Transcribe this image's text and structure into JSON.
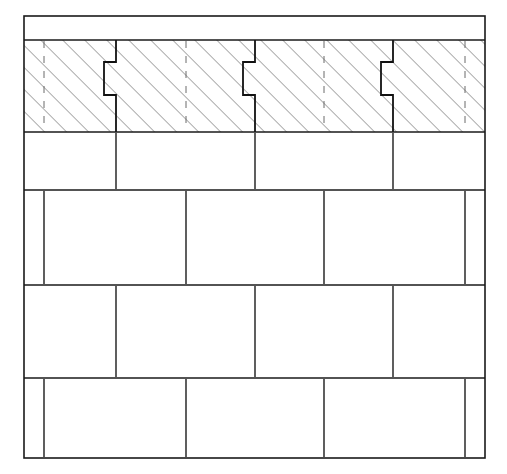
{
  "document": {
    "title": "Masonry Wall Bond — Section and Elevation",
    "drawing_type": "technical-line-drawing",
    "units": "pixels",
    "canvas": {
      "width": 507,
      "height": 474
    },
    "background_color": "#ffffff",
    "line_color": "#1a1a1a",
    "hatch_color": "#555555",
    "dashed_color": "#6a6a6a"
  },
  "geometry": {
    "outline": {
      "x": 24,
      "y": 16,
      "width": 461,
      "height": 442,
      "stroke_width": 1.6
    },
    "rows": [
      {
        "name": "cap-course",
        "label": "Top cap course",
        "y_top": 16,
        "y_bottom": 40,
        "hatched": false,
        "joints_x": [],
        "joint_style": "none"
      },
      {
        "name": "sectioned-course",
        "label": "Sectioned course (cut plane)",
        "y_top": 40,
        "y_bottom": 132,
        "hatched": true,
        "joints_x": [
          116,
          255,
          393
        ],
        "joint_style": "stepped-interlock",
        "dashed_x": [
          44,
          186,
          324,
          465
        ]
      },
      {
        "name": "course-1",
        "label": "Course 1",
        "y_top": 132,
        "y_bottom": 190,
        "hatched": false,
        "joints_x": [
          116,
          255,
          393
        ],
        "joint_style": "straight"
      },
      {
        "name": "course-2",
        "label": "Course 2",
        "y_top": 190,
        "y_bottom": 285,
        "hatched": false,
        "joints_x": [
          44,
          186,
          324,
          465
        ],
        "joint_style": "straight"
      },
      {
        "name": "course-3",
        "label": "Course 3",
        "y_top": 285,
        "y_bottom": 378,
        "hatched": false,
        "joints_x": [
          116,
          255,
          393
        ],
        "joint_style": "straight"
      },
      {
        "name": "course-4",
        "label": "Course 4",
        "y_top": 378,
        "y_bottom": 458,
        "hatched": false,
        "joints_x": [
          44,
          186,
          324,
          465
        ],
        "joint_style": "straight"
      }
    ],
    "step_joint": {
      "description": "Interlocking stepped joint profile used in the sectioned (hatched) course",
      "notch_depth": 12,
      "upper_run": 22,
      "middle_run": 33,
      "stroke_width": 1.8
    },
    "hatch": {
      "angle_degrees": 45,
      "direction": "bottom-left-to-top-right",
      "spacing": 11,
      "stroke_width": 1.0
    },
    "dashes": {
      "dash_length": 7,
      "gap_length": 8,
      "stroke_width": 1.0
    }
  }
}
